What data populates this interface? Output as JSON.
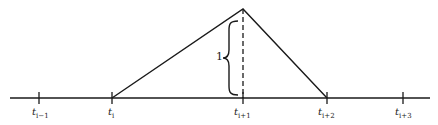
{
  "diagram": {
    "type": "hat-function",
    "axis": {
      "y": 98,
      "x_start": 10,
      "x_end": 430
    },
    "ticks": [
      {
        "x": 39,
        "base": "t",
        "sub": "i−1"
      },
      {
        "x": 112,
        "base": "t",
        "sub": "i"
      },
      {
        "x": 243,
        "base": "t",
        "sub": "i+1"
      },
      {
        "x": 327,
        "base": "t",
        "sub": "i+2"
      },
      {
        "x": 403,
        "base": "t",
        "sub": "i+3"
      }
    ],
    "apex": {
      "x": 243,
      "y": 9
    },
    "height_label": "1",
    "stroke_color": "#1a1a1a"
  }
}
